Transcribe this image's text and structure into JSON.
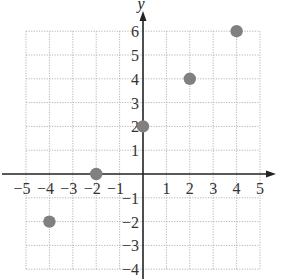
{
  "chart_data": {
    "type": "scatter",
    "title": "",
    "xlabel": "",
    "ylabel": "y",
    "xlim": [
      -5,
      5
    ],
    "ylim": [
      -4,
      6
    ],
    "grid": true,
    "x_ticks": [
      "−5",
      "−4",
      "−3",
      "−2",
      "−1",
      "1",
      "2",
      "3",
      "4",
      "5"
    ],
    "y_ticks": [
      "6",
      "5",
      "4",
      "3",
      "2",
      "1",
      "−1",
      "−2",
      "−3",
      "−4"
    ],
    "series": [
      {
        "name": "points",
        "color": "#808080",
        "points": [
          {
            "x": -4,
            "y": -2
          },
          {
            "x": -2,
            "y": 0
          },
          {
            "x": 0,
            "y": 2
          },
          {
            "x": 2,
            "y": 4
          },
          {
            "x": 4,
            "y": 6
          }
        ]
      }
    ]
  }
}
